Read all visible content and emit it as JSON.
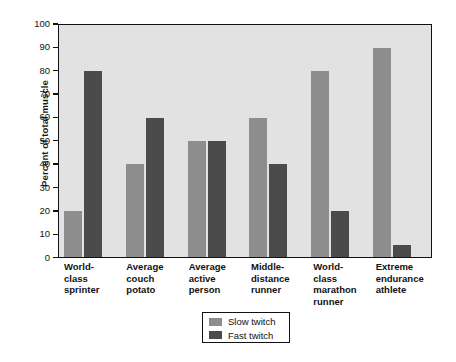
{
  "chart_data": {
    "type": "bar",
    "title": "",
    "xlabel": "",
    "ylabel": "Percent of total muscle",
    "ylim": [
      0,
      100
    ],
    "yticks": [
      0,
      10,
      20,
      30,
      40,
      50,
      60,
      70,
      80,
      90,
      100
    ],
    "grid": false,
    "legend_position": "bottom-center",
    "categories": [
      "World-\nclass\nsprinter",
      "Average\ncouch\npotato",
      "Average\nactive\nperson",
      "Middle-\ndistance\nrunner",
      "World-\nclass\nmarathon\nrunner",
      "Extreme\nendurance\nathlete"
    ],
    "category_lines": [
      [
        "World-",
        "class",
        "sprinter"
      ],
      [
        "Average",
        "couch",
        "potato"
      ],
      [
        "Average",
        "active",
        "person"
      ],
      [
        "Middle-",
        "distance",
        "runner"
      ],
      [
        "World-",
        "class",
        "marathon",
        "runner"
      ],
      [
        "Extreme",
        "endurance",
        "athlete"
      ]
    ],
    "series": [
      {
        "name": "Slow twitch",
        "color": "#8d8d8d",
        "values": [
          20,
          40,
          50,
          60,
          80,
          90
        ]
      },
      {
        "name": "Fast twitch",
        "color": "#4b4b4b",
        "values": [
          80,
          60,
          50,
          40,
          20,
          5
        ]
      }
    ]
  },
  "axes": {
    "y_title": "Percent of total muscle",
    "plot_background": "#e2e2e2",
    "frame_color": "#111111"
  },
  "legend": {
    "items": [
      {
        "label": "Slow twitch",
        "swatch": "#8d8d8d"
      },
      {
        "label": "Fast twitch",
        "swatch": "#4b4b4b"
      }
    ]
  }
}
